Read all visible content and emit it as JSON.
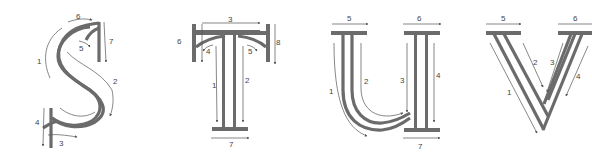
{
  "figure": {
    "letters": [
      {
        "letter": "S",
        "stroke_labels": [
          "1",
          "2",
          "3",
          "4",
          "5",
          "6",
          "7"
        ]
      },
      {
        "letter": "T",
        "stroke_labels": [
          "1",
          "2",
          "3",
          "4",
          "5",
          "6",
          "7",
          "8"
        ]
      },
      {
        "letter": "U",
        "stroke_labels": [
          "1",
          "2",
          "3",
          "4",
          "5",
          "6",
          "7"
        ]
      },
      {
        "letter": "V",
        "stroke_labels": [
          "1",
          "2",
          "3",
          "4",
          "5",
          "6"
        ]
      }
    ],
    "colors": {
      "letter_stroke": "#6b6b6b",
      "guide_arrow": "#555555",
      "background": "#ffffff"
    }
  }
}
